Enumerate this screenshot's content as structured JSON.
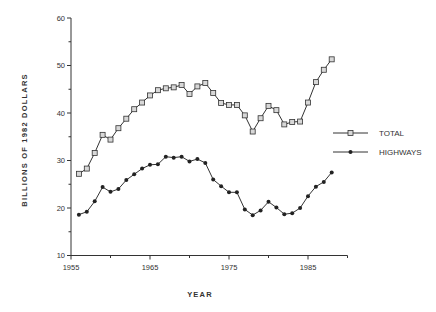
{
  "chart_data": {
    "type": "line",
    "title": "",
    "xlabel": "YEAR",
    "ylabel": "BILLIONS OF 1982 DOLLARS",
    "xlim": [
      1955,
      1990
    ],
    "ylim": [
      10,
      60
    ],
    "x_ticks": [
      1955,
      1965,
      1975,
      1985
    ],
    "x_tick_labels": [
      "1955",
      "1965",
      "1975",
      "1985"
    ],
    "y_ticks": [
      10,
      20,
      30,
      40,
      50,
      60
    ],
    "y_tick_labels": [
      "10",
      "20",
      "30",
      "40",
      "50",
      "60"
    ],
    "grid": false,
    "legend_position": "right",
    "x": [
      1956,
      1957,
      1958,
      1959,
      1960,
      1961,
      1962,
      1963,
      1964,
      1965,
      1966,
      1967,
      1968,
      1969,
      1970,
      1971,
      1972,
      1973,
      1974,
      1975,
      1976,
      1977,
      1978,
      1979,
      1980,
      1981,
      1982,
      1983,
      1984,
      1985,
      1986,
      1987,
      1988
    ],
    "series": [
      {
        "name": "TOTAL",
        "marker": "square-open",
        "values": [
          27.2,
          28.3,
          31.6,
          35.4,
          34.4,
          36.8,
          38.8,
          40.8,
          42.2,
          43.7,
          44.8,
          45.2,
          45.4,
          45.9,
          44.0,
          45.6,
          46.3,
          44.2,
          42.1,
          41.7,
          41.7,
          39.5,
          36.1,
          38.9,
          41.5,
          40.6,
          37.6,
          38.1,
          38.2,
          42.2,
          46.5,
          49.1,
          51.3
        ]
      },
      {
        "name": "HIGHWAYS",
        "marker": "diamond-filled",
        "values": [
          18.6,
          19.2,
          21.4,
          24.4,
          23.4,
          24.0,
          25.9,
          27.1,
          28.3,
          29.1,
          29.2,
          30.8,
          30.6,
          30.8,
          29.8,
          30.3,
          29.5,
          26.0,
          24.6,
          23.3,
          23.3,
          19.7,
          18.5,
          19.5,
          21.3,
          20.1,
          18.7,
          18.9,
          20.0,
          22.5,
          24.5,
          25.5,
          27.5
        ]
      }
    ]
  },
  "legend": {
    "items": [
      {
        "label": "TOTAL"
      },
      {
        "label": "HIGHWAYS"
      }
    ]
  },
  "colors": {
    "line": "#333333",
    "marker_fill_total": "#d8d8d8",
    "marker_fill_highways": "#222222"
  }
}
